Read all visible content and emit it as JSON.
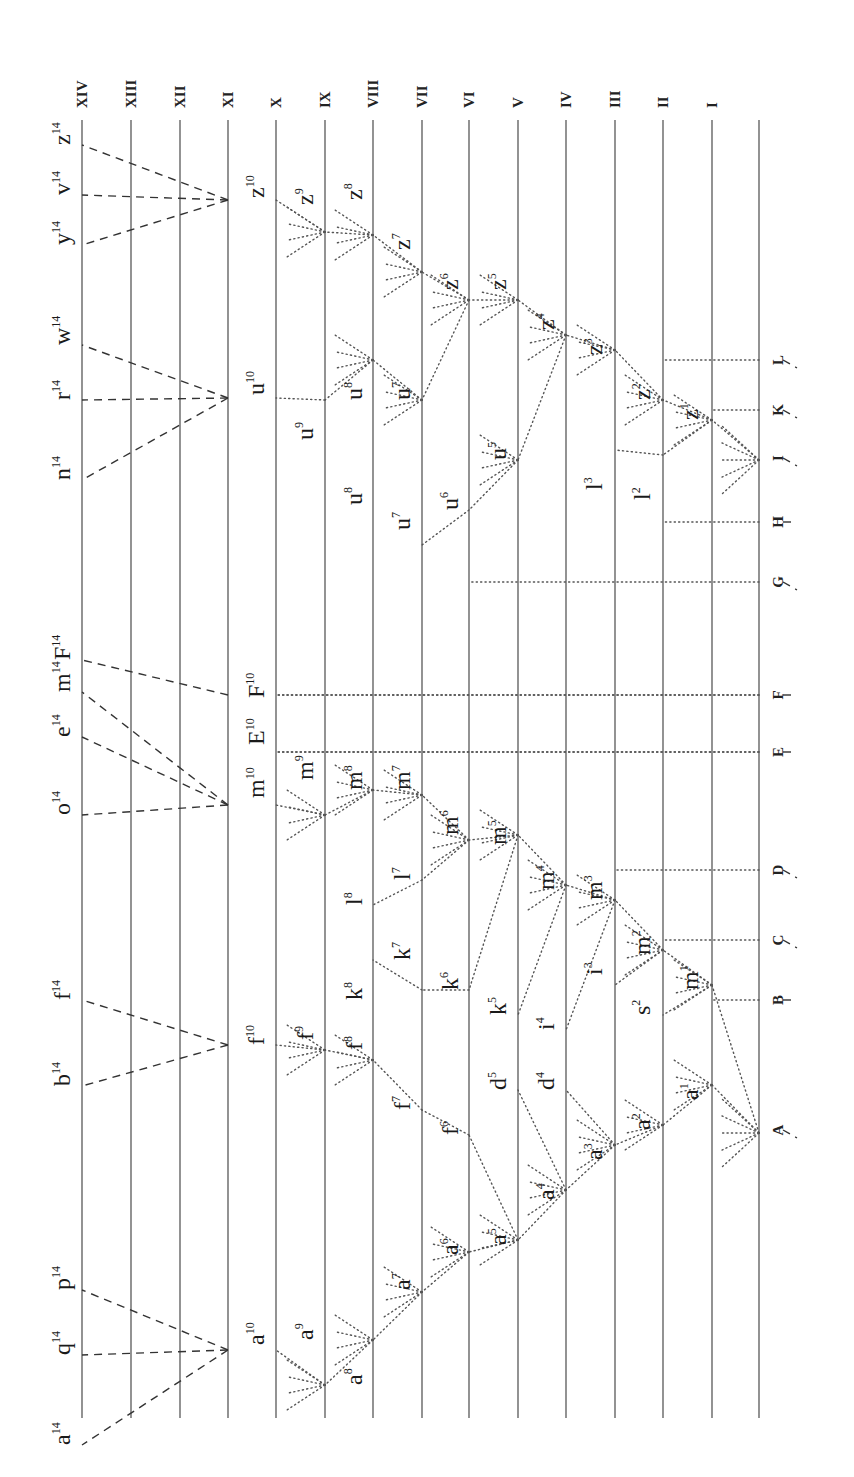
{
  "diagram": {
    "orientation": "rotated 90deg counter-clockwise; generations run right-to-left",
    "generation_labels": [
      "XIV",
      "XIII",
      "XII",
      "XI",
      "X",
      "IX",
      "VIII",
      "VII",
      "VI",
      "V",
      "IV",
      "III",
      "II",
      "I"
    ],
    "ancestral_species": [
      "A",
      "B",
      "C",
      "D",
      "E",
      "F",
      "G",
      "H",
      "I",
      "K",
      "L"
    ],
    "generation_lines_x": [
      82,
      131,
      180,
      228,
      276,
      325,
      373,
      422,
      469,
      518,
      566,
      615,
      663,
      712,
      759
    ],
    "species_labels": [
      {
        "id": "a14",
        "base": "a",
        "sup": "14",
        "x": 70,
        "y": 1445
      },
      {
        "id": "q14",
        "base": "q",
        "sup": "14",
        "x": 70,
        "y": 1355
      },
      {
        "id": "p14",
        "base": "p",
        "sup": "14",
        "x": 70,
        "y": 1290
      },
      {
        "id": "b14",
        "base": "b",
        "sup": "14",
        "x": 70,
        "y": 1086
      },
      {
        "id": "f14",
        "base": "f",
        "sup": "14",
        "x": 70,
        "y": 1000
      },
      {
        "id": "o14",
        "base": "o",
        "sup": "14",
        "x": 70,
        "y": 815
      },
      {
        "id": "e14",
        "base": "e",
        "sup": "14",
        "x": 70,
        "y": 737
      },
      {
        "id": "m14",
        "base": "m",
        "sup": "14",
        "x": 70,
        "y": 692
      },
      {
        "id": "F14",
        "base": "F",
        "sup": "14",
        "x": 70,
        "y": 660
      },
      {
        "id": "n14",
        "base": "n",
        "sup": "14",
        "x": 70,
        "y": 480
      },
      {
        "id": "r14",
        "base": "r",
        "sup": "14",
        "x": 70,
        "y": 400
      },
      {
        "id": "w14",
        "base": "w",
        "sup": "14",
        "x": 70,
        "y": 345
      },
      {
        "id": "y14",
        "base": "y",
        "sup": "14",
        "x": 70,
        "y": 245
      },
      {
        "id": "v14",
        "base": "v",
        "sup": "14",
        "x": 70,
        "y": 195
      },
      {
        "id": "z14",
        "base": "z",
        "sup": "14",
        "x": 70,
        "y": 145
      },
      {
        "id": "a10",
        "base": "a",
        "sup": "10",
        "x": 264,
        "y": 1345
      },
      {
        "id": "f10",
        "base": "f",
        "sup": "10",
        "x": 264,
        "y": 1045
      },
      {
        "id": "m10",
        "base": "m",
        "sup": "10",
        "x": 264,
        "y": 798
      },
      {
        "id": "E10",
        "base": "E",
        "sup": "10",
        "x": 264,
        "y": 745
      },
      {
        "id": "F10",
        "base": "F",
        "sup": "10",
        "x": 264,
        "y": 698
      },
      {
        "id": "u10",
        "base": "u",
        "sup": "10",
        "x": 264,
        "y": 395
      },
      {
        "id": "z10",
        "base": "z",
        "sup": "10",
        "x": 264,
        "y": 198
      },
      {
        "id": "a9",
        "base": "a",
        "sup": "9",
        "x": 313,
        "y": 1340
      },
      {
        "id": "f9",
        "base": "f",
        "sup": "9",
        "x": 313,
        "y": 1040
      },
      {
        "id": "m9",
        "base": "m",
        "sup": "9",
        "x": 313,
        "y": 780
      },
      {
        "id": "u9",
        "base": "u",
        "sup": "9",
        "x": 313,
        "y": 440
      },
      {
        "id": "z9",
        "base": "z",
        "sup": "9",
        "x": 313,
        "y": 205
      },
      {
        "id": "a8",
        "base": "a",
        "sup": "8",
        "x": 362,
        "y": 1385
      },
      {
        "id": "f8",
        "base": "f",
        "sup": "8",
        "x": 362,
        "y": 1050
      },
      {
        "id": "k8",
        "base": "k",
        "sup": "8",
        "x": 362,
        "y": 1000
      },
      {
        "id": "l8",
        "base": "l",
        "sup": "8",
        "x": 362,
        "y": 905
      },
      {
        "id": "m8",
        "base": "m",
        "sup": "8",
        "x": 362,
        "y": 790
      },
      {
        "id": "u8a",
        "base": "u",
        "sup": "8",
        "x": 362,
        "y": 400
      },
      {
        "id": "u8b",
        "base": "u",
        "sup": "8",
        "x": 362,
        "y": 505
      },
      {
        "id": "z8",
        "base": "z",
        "sup": "8",
        "x": 362,
        "y": 200
      },
      {
        "id": "a7",
        "base": "a",
        "sup": "7",
        "x": 410,
        "y": 1290
      },
      {
        "id": "f7",
        "base": "f",
        "sup": "7",
        "x": 410,
        "y": 1110
      },
      {
        "id": "k7",
        "base": "k",
        "sup": "7",
        "x": 410,
        "y": 960
      },
      {
        "id": "l7",
        "base": "l",
        "sup": "7",
        "x": 410,
        "y": 880
      },
      {
        "id": "m7",
        "base": "m",
        "sup": "7",
        "x": 410,
        "y": 790
      },
      {
        "id": "u7a",
        "base": "u",
        "sup": "7",
        "x": 410,
        "y": 400
      },
      {
        "id": "u7b",
        "base": "u",
        "sup": "7",
        "x": 410,
        "y": 530
      },
      {
        "id": "z7",
        "base": "z",
        "sup": "7",
        "x": 410,
        "y": 250
      },
      {
        "id": "a6",
        "base": "a",
        "sup": "6",
        "x": 458,
        "y": 1255
      },
      {
        "id": "f6",
        "base": "f",
        "sup": "6",
        "x": 458,
        "y": 1135
      },
      {
        "id": "k6",
        "base": "k",
        "sup": "6",
        "x": 458,
        "y": 990
      },
      {
        "id": "m6",
        "base": "m",
        "sup": "6",
        "x": 458,
        "y": 835
      },
      {
        "id": "u6",
        "base": "u",
        "sup": "6",
        "x": 458,
        "y": 510
      },
      {
        "id": "z6",
        "base": "z",
        "sup": "6",
        "x": 458,
        "y": 290
      },
      {
        "id": "a5",
        "base": "a",
        "sup": "5",
        "x": 506,
        "y": 1245
      },
      {
        "id": "d5",
        "base": "d",
        "sup": "5",
        "x": 506,
        "y": 1090
      },
      {
        "id": "k5",
        "base": "k",
        "sup": "5",
        "x": 506,
        "y": 1015
      },
      {
        "id": "m5",
        "base": "m",
        "sup": "5",
        "x": 506,
        "y": 845
      },
      {
        "id": "u5",
        "base": "u",
        "sup": "5",
        "x": 506,
        "y": 460
      },
      {
        "id": "z5",
        "base": "z",
        "sup": "5",
        "x": 506,
        "y": 290
      },
      {
        "id": "a4",
        "base": "a",
        "sup": "4",
        "x": 554,
        "y": 1200
      },
      {
        "id": "d4",
        "base": "d",
        "sup": "4",
        "x": 554,
        "y": 1090
      },
      {
        "id": "i4",
        "base": "i",
        "sup": "4",
        "x": 554,
        "y": 1030
      },
      {
        "id": "m4",
        "base": "m",
        "sup": "4",
        "x": 554,
        "y": 890
      },
      {
        "id": "z4",
        "base": "z",
        "sup": "4",
        "x": 554,
        "y": 330
      },
      {
        "id": "a3",
        "base": "a",
        "sup": "3",
        "x": 602,
        "y": 1160
      },
      {
        "id": "i3",
        "base": "i",
        "sup": "3",
        "x": 602,
        "y": 975
      },
      {
        "id": "m3",
        "base": "m",
        "sup": "3",
        "x": 602,
        "y": 900
      },
      {
        "id": "l3",
        "base": "l",
        "sup": "3",
        "x": 602,
        "y": 490
      },
      {
        "id": "z3",
        "base": "z",
        "sup": "3",
        "x": 602,
        "y": 355
      },
      {
        "id": "a2",
        "base": "a",
        "sup": "2",
        "x": 650,
        "y": 1130
      },
      {
        "id": "s2",
        "base": "s",
        "sup": "2",
        "x": 650,
        "y": 1015
      },
      {
        "id": "m2",
        "base": "m",
        "sup": "2",
        "x": 650,
        "y": 955
      },
      {
        "id": "l2",
        "base": "l",
        "sup": "2",
        "x": 650,
        "y": 500
      },
      {
        "id": "z2",
        "base": "z",
        "sup": "2",
        "x": 650,
        "y": 400
      },
      {
        "id": "a1",
        "base": "a",
        "sup": "1",
        "x": 698,
        "y": 1100
      },
      {
        "id": "m1",
        "base": "m",
        "sup": "1",
        "x": 698,
        "y": 990
      },
      {
        "id": "z1",
        "base": "z",
        "sup": "1",
        "x": 698,
        "y": 420
      }
    ],
    "ancestor_label_y": {
      "A": 1130,
      "B": 1000,
      "C": 940,
      "D": 870,
      "E": 752,
      "F": 695,
      "G": 582,
      "H": 522,
      "I": 458,
      "K": 410,
      "L": 360
    }
  }
}
